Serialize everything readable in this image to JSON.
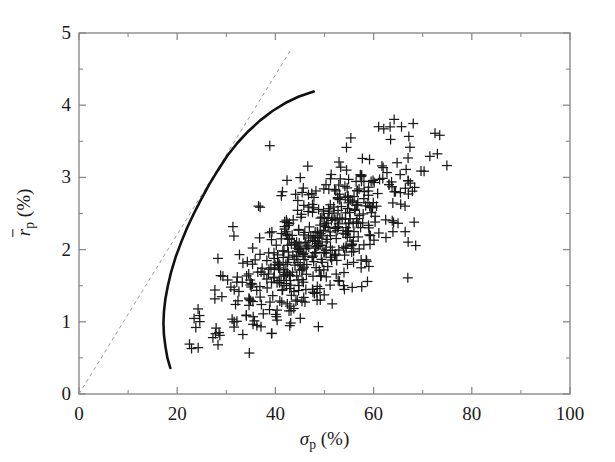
{
  "chart_data": {
    "type": "scatter",
    "title": "",
    "subtitle": "",
    "xlabel": "sigma_p (%)",
    "ylabel": "r-bar_p (%)",
    "xlabel_parts": {
      "symbol": "σ",
      "subscript": "p",
      "unit": "(%)"
    },
    "ylabel_parts": {
      "symbol": "r",
      "overbar": true,
      "subscript": "p",
      "unit": "(%)"
    },
    "xlim": [
      0,
      100
    ],
    "ylim": [
      0,
      5
    ],
    "xticks": [
      0,
      20,
      40,
      60,
      80,
      100
    ],
    "yticks": [
      0,
      1,
      2,
      3,
      4,
      5
    ],
    "xtick_labels": [
      "0",
      "20",
      "40",
      "60",
      "80",
      "100"
    ],
    "ytick_labels": [
      "0",
      "1",
      "2",
      "3",
      "4",
      "5"
    ],
    "x_minor_tick_interval": 10,
    "y_minor_tick_interval": 0.5,
    "grid": false,
    "legend": false,
    "legend_position": "none",
    "axis_color": "#8a8a8a",
    "series": [
      {
        "name": "individual-assets",
        "type": "scatter",
        "marker": "plus",
        "color": "#1a1a1a",
        "marker_size": 5,
        "point_count": 512,
        "x_range": [
          17.5,
          87.0
        ],
        "y_range": [
          0.36,
          4.25
        ],
        "cluster_center": [
          48.0,
          2.05
        ],
        "description": "Risk-return coordinates of individual assets forming an elongated cloud rising from lower-left to upper-right"
      },
      {
        "name": "efficient-frontier",
        "type": "line",
        "style": "solid",
        "color": "#111111",
        "line_width": 2.6,
        "vertex": [
          18.0,
          0.36
        ],
        "end_point": [
          48.0,
          4.2
        ],
        "points": [
          [
            18.6,
            0.36
          ],
          [
            18.0,
            0.5
          ],
          [
            17.6,
            0.66
          ],
          [
            17.3,
            0.82
          ],
          [
            17.2,
            0.98
          ],
          [
            17.3,
            1.14
          ],
          [
            17.6,
            1.32
          ],
          [
            18.1,
            1.5
          ],
          [
            18.8,
            1.7
          ],
          [
            19.7,
            1.9
          ],
          [
            20.8,
            2.1
          ],
          [
            22.0,
            2.3
          ],
          [
            23.4,
            2.5
          ],
          [
            24.9,
            2.7
          ],
          [
            26.5,
            2.9
          ],
          [
            28.3,
            3.1
          ],
          [
            30.2,
            3.3
          ],
          [
            32.3,
            3.48
          ],
          [
            34.5,
            3.64
          ],
          [
            36.9,
            3.79
          ],
          [
            39.4,
            3.92
          ],
          [
            42.0,
            4.03
          ],
          [
            44.8,
            4.12
          ],
          [
            47.8,
            4.19
          ]
        ]
      },
      {
        "name": "capital-market-line",
        "type": "line",
        "style": "dashed",
        "color": "#999999",
        "line_width": 1.0,
        "start_point": [
          0,
          0
        ],
        "end_point": [
          43.0,
          4.75
        ],
        "tangency_point": [
          28.3,
          3.1
        ],
        "slope": 0.1104
      }
    ],
    "annotations": []
  }
}
